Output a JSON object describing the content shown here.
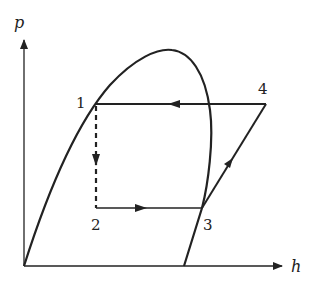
{
  "diagram": {
    "type": "pressure-enthalpy (p-h) diagram",
    "axes": {
      "y_label": "p",
      "x_label": "h"
    },
    "points": [
      {
        "id": "1",
        "label": "1"
      },
      {
        "id": "2",
        "label": "2"
      },
      {
        "id": "3",
        "label": "3"
      },
      {
        "id": "4",
        "label": "4"
      }
    ],
    "processes": [
      {
        "from": "4",
        "to": "1",
        "style": "solid",
        "direction": "leftward"
      },
      {
        "from": "1",
        "to": "2",
        "style": "dashed",
        "direction": "downward"
      },
      {
        "from": "2",
        "to": "3",
        "style": "solid",
        "direction": "rightward"
      },
      {
        "from": "3",
        "to": "4",
        "style": "solid",
        "direction": "up-right"
      }
    ],
    "colors": {
      "line": "#222222",
      "background": "#ffffff"
    }
  }
}
